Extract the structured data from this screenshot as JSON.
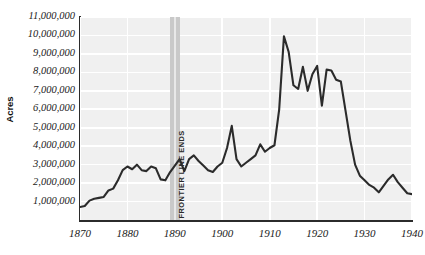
{
  "chart_data": {
    "type": "line",
    "title": "",
    "xlabel": "",
    "ylabel": "Acres",
    "xlim": [
      1870,
      1940
    ],
    "ylim": [
      0,
      11000000
    ],
    "grid": true,
    "legend": null,
    "yticks": [
      "1,000,000",
      "2,000,000",
      "3,000,000",
      "4,000,000",
      "5,000,000",
      "6,000,000",
      "7,000,000",
      "8,000,000",
      "9,000,000",
      "10,000,000",
      "11,000,000"
    ],
    "ytick_values": [
      1000000,
      2000000,
      3000000,
      4000000,
      5000000,
      6000000,
      7000000,
      8000000,
      9000000,
      10000000,
      11000000
    ],
    "xticks": [
      "1870",
      "1880",
      "1890",
      "1900",
      "1910",
      "1920",
      "1930",
      "1940"
    ],
    "xtick_values": [
      1870,
      1880,
      1890,
      1900,
      1910,
      1920,
      1930,
      1940
    ],
    "line_color": "#2b2b2b",
    "plot_background": "#f0f0f0",
    "gridline_color": "#ffffff",
    "annotations": [
      {
        "label": "FRONTIER LINE ENDS",
        "type": "vertical-band",
        "x_start": 1889,
        "x_end": 1891,
        "color": "#c9c9c9"
      }
    ],
    "x": [
      1870,
      1871,
      1872,
      1873,
      1874,
      1875,
      1876,
      1877,
      1878,
      1879,
      1880,
      1881,
      1882,
      1883,
      1884,
      1885,
      1886,
      1887,
      1888,
      1889,
      1890,
      1891,
      1892,
      1893,
      1894,
      1895,
      1896,
      1897,
      1898,
      1899,
      1900,
      1901,
      1902,
      1903,
      1904,
      1905,
      1906,
      1907,
      1908,
      1909,
      1910,
      1911,
      1912,
      1913,
      1914,
      1915,
      1916,
      1917,
      1918,
      1919,
      1920,
      1921,
      1922,
      1923,
      1924,
      1925,
      1926,
      1927,
      1928,
      1929,
      1930,
      1931,
      1932,
      1933,
      1934,
      1935,
      1936,
      1937,
      1938,
      1939,
      1940
    ],
    "values": [
      700000,
      760000,
      1050000,
      1150000,
      1200000,
      1250000,
      1600000,
      1700000,
      2150000,
      2700000,
      2900000,
      2750000,
      3000000,
      2700000,
      2650000,
      2900000,
      2800000,
      2200000,
      2150000,
      2600000,
      2950000,
      3300000,
      2650000,
      3300000,
      3500000,
      3200000,
      2950000,
      2700000,
      2600000,
      2900000,
      3100000,
      3900000,
      5100000,
      3300000,
      2900000,
      3100000,
      3300000,
      3500000,
      4100000,
      3700000,
      3900000,
      4050000,
      6000000,
      9950000,
      9100000,
      7300000,
      7100000,
      8300000,
      7000000,
      7900000,
      8350000,
      6200000,
      8150000,
      8100000,
      7600000,
      7500000,
      5900000,
      4300000,
      3000000,
      2400000,
      2150000,
      1900000,
      1750000,
      1500000,
      1850000,
      2200000,
      2450000,
      2050000,
      1750000,
      1450000,
      1400000
    ]
  }
}
